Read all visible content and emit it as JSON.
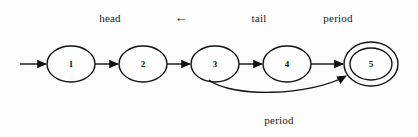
{
  "figure": {
    "type": "state-machine-diagram",
    "background_color": "#fdfdfd",
    "stroke_color": "#111111",
    "width": 418,
    "height": 137
  },
  "top_labels": [
    {
      "id": "head",
      "text": "head",
      "x": 110,
      "y": 18
    },
    {
      "id": "left-arrow",
      "text": "←",
      "x": 181,
      "y": 18
    },
    {
      "id": "tail",
      "text": "tail",
      "x": 259,
      "y": 18
    },
    {
      "id": "period-top",
      "text": "period",
      "x": 338,
      "y": 18
    }
  ],
  "bottom_labels": [
    {
      "id": "period-bottom",
      "text": "period",
      "x": 279,
      "y": 120
    }
  ],
  "nodes": [
    {
      "id": "n1",
      "label": "1",
      "cx": 71,
      "cy": 64,
      "rx": 24,
      "ry": 18,
      "accepting": false
    },
    {
      "id": "n2",
      "label": "2",
      "cx": 143,
      "cy": 64,
      "rx": 24,
      "ry": 18,
      "accepting": false
    },
    {
      "id": "n3",
      "label": "3",
      "cx": 215,
      "cy": 64,
      "rx": 24,
      "ry": 18,
      "accepting": false
    },
    {
      "id": "n4",
      "label": "4",
      "cx": 287,
      "cy": 64,
      "rx": 24,
      "ry": 18,
      "accepting": false
    },
    {
      "id": "n5",
      "label": "5",
      "cx": 371,
      "cy": 64,
      "rx": 27,
      "ry": 22,
      "accepting": true,
      "inner_rx": 21,
      "inner_ry": 16
    }
  ],
  "edges": [
    {
      "id": "start-arrow",
      "from": "start",
      "to": "n1",
      "kind": "straight"
    },
    {
      "id": "e1-2",
      "from": "n1",
      "to": "n2",
      "kind": "straight"
    },
    {
      "id": "e2-3",
      "from": "n2",
      "to": "n3",
      "kind": "straight"
    },
    {
      "id": "e3-4",
      "from": "n3",
      "to": "n4",
      "kind": "straight"
    },
    {
      "id": "e4-5",
      "from": "n4",
      "to": "n5",
      "kind": "straight"
    },
    {
      "id": "e3-5-period",
      "from": "n3",
      "to": "n5",
      "kind": "curved",
      "label": "period"
    }
  ]
}
